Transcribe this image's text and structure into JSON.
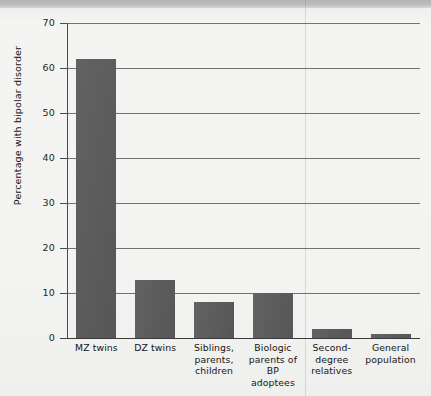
{
  "figure": {
    "background_color": "#f3f3f1",
    "banner_color": "#bcbcbc",
    "bar_color": "#5b5b5b",
    "axis_color": "#4a4a4a"
  },
  "chart_data": {
    "type": "bar",
    "title": "",
    "xlabel": "",
    "ylabel": "Percentage with bipolar disorder",
    "ylim": [
      0,
      70
    ],
    "yticks": [
      0,
      10,
      20,
      30,
      40,
      50,
      60,
      70
    ],
    "ytick_labels": [
      "0",
      "10",
      "20",
      "30",
      "40",
      "50",
      "60",
      "70"
    ],
    "grid": true,
    "legend": "none",
    "categories": [
      "MZ twins",
      "DZ twins",
      "Siblings, parents, children",
      "Biologic parents of BP adoptees",
      "Second-degree relatives",
      "General population"
    ],
    "category_lines": [
      [
        "MZ twins"
      ],
      [
        "DZ twins"
      ],
      [
        "Siblings,",
        "parents,",
        "children"
      ],
      [
        "Biologic",
        "parents of",
        "BP adoptees"
      ],
      [
        "Second-",
        "degree",
        "relatives"
      ],
      [
        "General",
        "population"
      ]
    ],
    "values": [
      62,
      13,
      8,
      10,
      2,
      1
    ],
    "value_unit": "percent"
  }
}
